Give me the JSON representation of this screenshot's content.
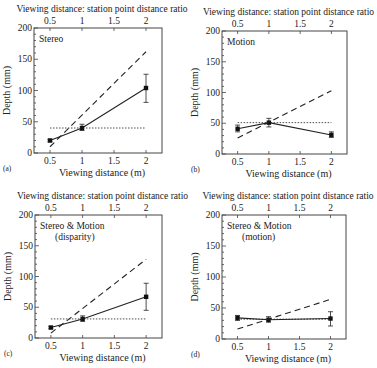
{
  "figure": {
    "panel_order": [
      "a",
      "b",
      "c",
      "d"
    ]
  },
  "chart_data": [
    {
      "id": "a",
      "panel_label": "(a)",
      "type": "line",
      "title": "Stereo",
      "title_lines": [
        "Stereo"
      ],
      "xlabel": "Viewing distance (m)",
      "xlabel_top": "Viewing distance: station point distance ratio",
      "ylabel": "Depth (mm)",
      "x": [
        0.5,
        1,
        2
      ],
      "xticks": [
        "0.5",
        "1",
        "1.5",
        "2"
      ],
      "xtick_values": [
        0.5,
        1,
        1.5,
        2
      ],
      "yticks": [
        "0",
        "50",
        "100",
        "150",
        "200"
      ],
      "ytick_values": [
        0,
        50,
        100,
        150,
        200
      ],
      "xlim": [
        0.25,
        2.25
      ],
      "ylim": [
        0,
        200
      ],
      "series": [
        {
          "name": "Observed depth",
          "style": "solid",
          "marker": "square",
          "values": [
            20,
            40,
            104
          ],
          "err_low": [
            18,
            36,
            81
          ],
          "err_high": [
            22,
            46,
            126
          ]
        },
        {
          "name": "Predicted (distance scaling)",
          "style": "dashed",
          "x": [
            0.5,
            2
          ],
          "values": [
            10,
            162
          ]
        },
        {
          "name": "Constant depth",
          "style": "dotted",
          "x": [
            0.5,
            2
          ],
          "values": [
            40,
            40
          ]
        }
      ],
      "frame": {
        "left": 34,
        "top": 28,
        "right": 162,
        "bottom": 153
      }
    },
    {
      "id": "b",
      "panel_label": "(b)",
      "type": "line",
      "title": "Motion",
      "title_lines": [
        "Motion"
      ],
      "xlabel": "Viewing distance (m)",
      "xlabel_top": "Viewing distance: station point distance ratio",
      "ylabel": "Depth (mm)",
      "x": [
        0.5,
        1,
        2
      ],
      "xticks": [
        "0.5",
        "1",
        "1.5",
        "2"
      ],
      "xtick_values": [
        0.5,
        1,
        1.5,
        2
      ],
      "yticks": [
        "0",
        "50",
        "100",
        "150",
        "200"
      ],
      "ytick_values": [
        0,
        50,
        100,
        150,
        200
      ],
      "xlim": [
        0.25,
        2.25
      ],
      "ylim": [
        0,
        200
      ],
      "series": [
        {
          "name": "Observed depth",
          "style": "solid",
          "marker": "square",
          "values": [
            41,
            51,
            31
          ],
          "err_low": [
            36,
            44,
            27
          ],
          "err_high": [
            47,
            58,
            36
          ]
        },
        {
          "name": "Predicted (distance scaling)",
          "style": "dashed",
          "x": [
            0.5,
            2
          ],
          "values": [
            26,
            103
          ]
        },
        {
          "name": "Constant depth",
          "style": "dotted",
          "x": [
            0.5,
            2
          ],
          "values": [
            51,
            51
          ]
        }
      ],
      "frame": {
        "left": 222,
        "top": 31,
        "right": 347,
        "bottom": 154
      }
    },
    {
      "id": "c",
      "panel_label": "(c)",
      "type": "line",
      "title": "Stereo & Motion (disparity)",
      "title_lines": [
        "Stereo & Motion",
        "(disparity)"
      ],
      "xlabel": "Viewing distance (m)",
      "xlabel_top": "Viewing distance: station point distance ratio",
      "ylabel": "Depth (mm)",
      "x": [
        0.5,
        1,
        2
      ],
      "xticks": [
        "0.5",
        "1",
        "1.5",
        "2"
      ],
      "xtick_values": [
        0.5,
        1,
        1.5,
        2
      ],
      "yticks": [
        "0",
        "50",
        "100",
        "150",
        "200"
      ],
      "ytick_values": [
        0,
        50,
        100,
        150,
        200
      ],
      "xlim": [
        0.25,
        2.25
      ],
      "ylim": [
        0,
        200
      ],
      "series": [
        {
          "name": "Observed depth",
          "style": "solid",
          "marker": "square",
          "values": [
            17,
            31,
            67
          ],
          "err_low": [
            15,
            27,
            45
          ],
          "err_high": [
            19,
            36,
            89
          ]
        },
        {
          "name": "Predicted (distance scaling)",
          "style": "dashed",
          "x": [
            0.5,
            2
          ],
          "values": [
            8,
            128
          ]
        },
        {
          "name": "Constant depth",
          "style": "dotted",
          "x": [
            0.5,
            2
          ],
          "values": [
            31,
            31
          ]
        }
      ],
      "frame": {
        "left": 35,
        "top": 215,
        "right": 162,
        "bottom": 338
      }
    },
    {
      "id": "d",
      "panel_label": "(d)",
      "type": "line",
      "title": "Stereo & Motion (motion)",
      "title_lines": [
        "Stereo & Motion",
        "(motion)"
      ],
      "xlabel": "Viewing distance (m)",
      "xlabel_top": "Viewing distance: station point distance ratio",
      "ylabel": "Depth (mm)",
      "x": [
        0.5,
        1,
        2
      ],
      "xticks": [
        "0.5",
        "1",
        "1.5",
        "2"
      ],
      "xtick_values": [
        0.5,
        1,
        1.5,
        2
      ],
      "yticks": [
        "0",
        "50",
        "100",
        "150",
        "200"
      ],
      "ytick_values": [
        0,
        50,
        100,
        150,
        200
      ],
      "xlim": [
        0.25,
        2.25
      ],
      "ylim": [
        0,
        200
      ],
      "series": [
        {
          "name": "Observed depth",
          "style": "solid",
          "marker": "square",
          "values": [
            34,
            31,
            33
          ],
          "err_low": [
            30,
            27,
            21
          ],
          "err_high": [
            38,
            36,
            44
          ]
        },
        {
          "name": "Predicted (distance scaling)",
          "style": "dashed",
          "x": [
            0.5,
            2
          ],
          "values": [
            16,
            64
          ]
        },
        {
          "name": "Constant depth",
          "style": "dotted",
          "x": [
            0.5,
            2
          ],
          "values": [
            32,
            32
          ]
        }
      ],
      "frame": {
        "left": 222,
        "top": 215,
        "right": 346,
        "bottom": 339
      }
    }
  ]
}
